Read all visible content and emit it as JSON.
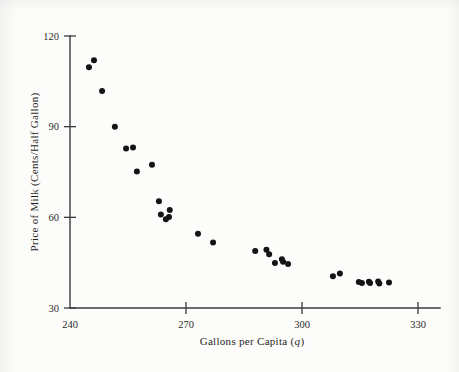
{
  "figure": {
    "background_color": "#fcfcfa",
    "ink_color": "#141414",
    "axis_color": "#3b3b3b"
  },
  "chart_data": {
    "type": "scatter",
    "title": "",
    "xlabel": "Gallons per Capita (q)",
    "xlabel_plain": "Gallons per Capita",
    "xlabel_italic_symbol": "q",
    "ylabel": "Price of Milk (Cents/Half Gallon)",
    "xlim": [
      240,
      330
    ],
    "ylim": [
      30,
      120
    ],
    "xticks": [
      240,
      270,
      300,
      330
    ],
    "xtick_labels": [
      "240",
      "270",
      "300",
      "330"
    ],
    "yticks": [
      30,
      60,
      90,
      120
    ],
    "ytick_labels": [
      "30",
      "60",
      "90",
      "120"
    ],
    "grid": false,
    "legend": false,
    "marker": "filled-circle",
    "marker_size": 3.0,
    "points": [
      {
        "x": 246.2,
        "y": 112.0
      },
      {
        "x": 244.9,
        "y": 109.7
      },
      {
        "x": 248.3,
        "y": 101.8
      },
      {
        "x": 251.6,
        "y": 90.0
      },
      {
        "x": 254.5,
        "y": 82.8
      },
      {
        "x": 256.3,
        "y": 83.1
      },
      {
        "x": 261.2,
        "y": 77.4
      },
      {
        "x": 257.3,
        "y": 75.2
      },
      {
        "x": 263.0,
        "y": 65.3
      },
      {
        "x": 265.8,
        "y": 62.4
      },
      {
        "x": 263.5,
        "y": 60.9
      },
      {
        "x": 265.6,
        "y": 60.1
      },
      {
        "x": 264.8,
        "y": 59.4
      },
      {
        "x": 273.1,
        "y": 54.6
      },
      {
        "x": 277.0,
        "y": 51.7
      },
      {
        "x": 287.9,
        "y": 48.9
      },
      {
        "x": 290.8,
        "y": 49.3
      },
      {
        "x": 291.5,
        "y": 47.8
      },
      {
        "x": 294.8,
        "y": 46.1
      },
      {
        "x": 295.1,
        "y": 45.3
      },
      {
        "x": 293.0,
        "y": 44.9
      },
      {
        "x": 296.4,
        "y": 44.6
      },
      {
        "x": 308.0,
        "y": 40.5
      },
      {
        "x": 309.8,
        "y": 41.4
      },
      {
        "x": 314.7,
        "y": 38.6
      },
      {
        "x": 315.5,
        "y": 38.3
      },
      {
        "x": 317.3,
        "y": 38.7
      },
      {
        "x": 317.6,
        "y": 38.3
      },
      {
        "x": 319.7,
        "y": 38.8
      },
      {
        "x": 320.0,
        "y": 38.1
      },
      {
        "x": 322.5,
        "y": 38.4
      }
    ]
  }
}
